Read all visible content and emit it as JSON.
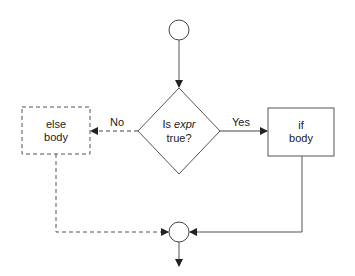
{
  "diagram": {
    "type": "flowchart",
    "nodes": {
      "start": {
        "shape": "circle"
      },
      "decision": {
        "shape": "diamond",
        "line1_prefix": "Is ",
        "line1_italic": "expr",
        "line2": "true?"
      },
      "else_body": {
        "shape": "dashed-rectangle",
        "line1": "else",
        "line2": "body"
      },
      "if_body": {
        "shape": "rectangle",
        "line1": "if",
        "line2": "body"
      },
      "end": {
        "shape": "circle"
      }
    },
    "edges": {
      "no_label": "No",
      "yes_label": "Yes"
    },
    "colors": {
      "stroke": "#333333",
      "text": "#222222",
      "background": "#ffffff"
    }
  }
}
